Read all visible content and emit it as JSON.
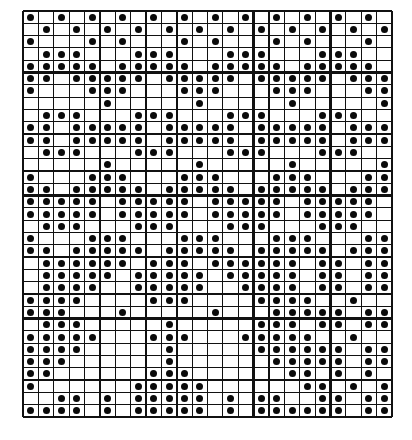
{
  "pattern": {
    "title": "Dot grid pattern chart",
    "columns": 24,
    "rows": 33,
    "major_every": 5,
    "line_color": "#111111",
    "dot_color": "#0a0a0a",
    "background": "#ffffff",
    "dots_by_row": [
      [
        0,
        2,
        4,
        6,
        8,
        10,
        12,
        14,
        16,
        18,
        20,
        22
      ],
      [
        1,
        3,
        5,
        7,
        9,
        11,
        13,
        15,
        17,
        19,
        21,
        23
      ],
      [
        0,
        4,
        6,
        10,
        12,
        16,
        18,
        22
      ],
      [
        1,
        2,
        3,
        7,
        8,
        9,
        13,
        14,
        15,
        19,
        20,
        21
      ],
      [
        0,
        1,
        2,
        3,
        4,
        6,
        7,
        8,
        9,
        10,
        12,
        13,
        14,
        15,
        16,
        18,
        19,
        20,
        21,
        22
      ],
      [
        0,
        1,
        3,
        4,
        5,
        6,
        7,
        9,
        10,
        11,
        12,
        13,
        15,
        16,
        17,
        18,
        19,
        21,
        22,
        23
      ],
      [
        0,
        4,
        5,
        6,
        10,
        11,
        12,
        16,
        17,
        18,
        22,
        23
      ],
      [
        5,
        11,
        17,
        23
      ],
      [
        1,
        2,
        3,
        7,
        8,
        9,
        13,
        14,
        15,
        19,
        20,
        21
      ],
      [
        0,
        1,
        3,
        4,
        5,
        6,
        7,
        9,
        10,
        11,
        12,
        13,
        15,
        16,
        17,
        18,
        19,
        21,
        22,
        23
      ],
      [
        0,
        1,
        3,
        4,
        5,
        6,
        7,
        9,
        10,
        11,
        12,
        13,
        15,
        16,
        17,
        18,
        19,
        21,
        22,
        23
      ],
      [
        1,
        2,
        3,
        7,
        8,
        9,
        13,
        14,
        15,
        19,
        20,
        21
      ],
      [
        5,
        11,
        17,
        23
      ],
      [
        0,
        4,
        5,
        6,
        10,
        11,
        12,
        16,
        17,
        18,
        22,
        23
      ],
      [
        0,
        1,
        3,
        4,
        5,
        6,
        7,
        9,
        10,
        11,
        12,
        13,
        15,
        16,
        17,
        18,
        19,
        21,
        22,
        23
      ],
      [
        0,
        1,
        2,
        3,
        4,
        6,
        7,
        8,
        9,
        10,
        12,
        13,
        14,
        15,
        16,
        18,
        19,
        20,
        21,
        22
      ],
      [
        0,
        1,
        2,
        3,
        4,
        6,
        7,
        8,
        9,
        10,
        12,
        13,
        14,
        15,
        16,
        18,
        19,
        20,
        21,
        22
      ],
      [
        1,
        2,
        3,
        7,
        8,
        9,
        13,
        14,
        15,
        19,
        20,
        21
      ],
      [
        0,
        4,
        5,
        6,
        10,
        11,
        12,
        16,
        17,
        18,
        22,
        23
      ],
      [
        0,
        1,
        3,
        4,
        5,
        6,
        7,
        9,
        10,
        11,
        12,
        13,
        15,
        16,
        17,
        18,
        19,
        21,
        22,
        23
      ],
      [
        1,
        2,
        3,
        4,
        5,
        6,
        8,
        9,
        10,
        12,
        13,
        14,
        15,
        16,
        17,
        19,
        20,
        22,
        23
      ],
      [
        1,
        2,
        3,
        4,
        5,
        7,
        8,
        9,
        10,
        11,
        13,
        14,
        15,
        16,
        17,
        19,
        20,
        22,
        23
      ],
      [
        1,
        2,
        3,
        4,
        7,
        8,
        9,
        10,
        11,
        14,
        15,
        16,
        17,
        19,
        20,
        22,
        23
      ],
      [
        0,
        1,
        2,
        3,
        8,
        9,
        10,
        15,
        16,
        17,
        18,
        21
      ],
      [
        0,
        1,
        2,
        6,
        12,
        16,
        17,
        18,
        19,
        20,
        22,
        23
      ],
      [
        1,
        2,
        3,
        9,
        15,
        16,
        17,
        19,
        20,
        22,
        23
      ],
      [
        0,
        1,
        2,
        3,
        4,
        8,
        9,
        10,
        14,
        15,
        16,
        17,
        18,
        21
      ],
      [
        0,
        1,
        2,
        3,
        9,
        15,
        16,
        17,
        18,
        19,
        20,
        22,
        23
      ],
      [
        0,
        1,
        2,
        9,
        16,
        17,
        18,
        19,
        20,
        22,
        23
      ],
      [
        0,
        1,
        8,
        9,
        10,
        17,
        18,
        20,
        22
      ],
      [
        0,
        7,
        8,
        9,
        10,
        11,
        18,
        19,
        21,
        23
      ],
      [
        2,
        3,
        5,
        7,
        8,
        9,
        10,
        11,
        13,
        15,
        16,
        19,
        20,
        22,
        23
      ],
      [
        0,
        1,
        2,
        3,
        5,
        7,
        8,
        9,
        10,
        11,
        13,
        15,
        16,
        17,
        18,
        19,
        20,
        22,
        23
      ]
    ]
  }
}
